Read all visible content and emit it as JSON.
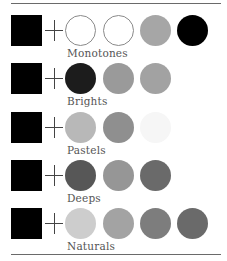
{
  "groups": [
    {
      "label": "Monotones",
      "base": "#000000",
      "swatches": [
        {
          "color": "#ffffff",
          "outlined": true
        },
        {
          "color": "#ffffff",
          "outlined": true
        },
        {
          "color": "#a6a6a6",
          "outlined": false
        },
        {
          "color": "#000000",
          "outlined": false
        }
      ]
    },
    {
      "label": "Brights",
      "base": "#000000",
      "swatches": [
        {
          "color": "#1c1c1c",
          "outlined": false
        },
        {
          "color": "#9a9a9a",
          "outlined": false
        },
        {
          "color": "#a2a2a2",
          "outlined": false
        }
      ]
    },
    {
      "label": "Pastels",
      "base": "#000000",
      "swatches": [
        {
          "color": "#b8b8b8",
          "outlined": false
        },
        {
          "color": "#8f8f8f",
          "outlined": false
        },
        {
          "color": "#f6f6f6",
          "outlined": false
        }
      ]
    },
    {
      "label": "Deeps",
      "base": "#000000",
      "swatches": [
        {
          "color": "#575757",
          "outlined": false
        },
        {
          "color": "#969696",
          "outlined": false
        },
        {
          "color": "#6a6a6a",
          "outlined": false
        }
      ]
    },
    {
      "label": "Naturals",
      "base": "#000000",
      "swatches": [
        {
          "color": "#cdcdcd",
          "outlined": false
        },
        {
          "color": "#a3a3a3",
          "outlined": false
        },
        {
          "color": "#7d7d7d",
          "outlined": false
        },
        {
          "color": "#6a6a6a",
          "outlined": false
        }
      ]
    }
  ]
}
